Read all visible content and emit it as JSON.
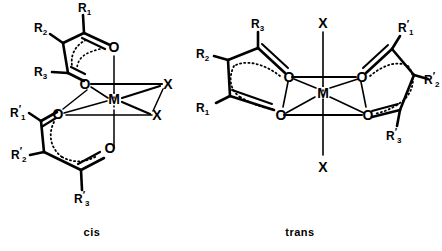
{
  "figure": {
    "title": "",
    "type": "chemical-structure-diagram",
    "background_color": "#ffffff",
    "line_color": "#000000",
    "structures": [
      {
        "id": "cis",
        "caption": "cis",
        "metal_label": "M",
        "ligand_labels": [
          "X",
          "X"
        ],
        "oxygen_labels": [
          "O",
          "O",
          "O",
          "O"
        ],
        "ring_top": {
          "substituents": [
            {
              "base": "R",
              "sub": "1",
              "prime": ""
            },
            {
              "base": "R",
              "sub": "2",
              "prime": ""
            },
            {
              "base": "R",
              "sub": "3",
              "prime": ""
            }
          ]
        },
        "ring_bottom": {
          "substituents": [
            {
              "base": "R",
              "sub": "1",
              "prime": "′"
            },
            {
              "base": "R",
              "sub": "2",
              "prime": "′"
            },
            {
              "base": "R",
              "sub": "3",
              "prime": "′"
            }
          ]
        }
      },
      {
        "id": "trans",
        "caption": "trans",
        "metal_label": "M",
        "ligand_labels": [
          "X",
          "X"
        ],
        "oxygen_labels": [
          "O",
          "O",
          "O",
          "O"
        ],
        "ring_left": {
          "substituents": [
            {
              "base": "R",
              "sub": "1",
              "prime": ""
            },
            {
              "base": "R",
              "sub": "2",
              "prime": ""
            },
            {
              "base": "R",
              "sub": "3",
              "prime": ""
            }
          ]
        },
        "ring_right": {
          "substituents": [
            {
              "base": "R",
              "sub": "1",
              "prime": "′"
            },
            {
              "base": "R",
              "sub": "2",
              "prime": "′"
            },
            {
              "base": "R",
              "sub": "3",
              "prime": "′"
            }
          ]
        }
      }
    ]
  },
  "labels": {
    "cis": {
      "metal": "M",
      "x_upper": "X",
      "x_lower": "X",
      "o_ne": "O",
      "o_nw": "O",
      "o_sw": "O",
      "o_se": "O",
      "r1": "R",
      "r1_sub": "1",
      "r2": "R",
      "r2_sub": "2",
      "r3": "R",
      "r3_sub": "3",
      "r1p": "R",
      "r1p_sub": "1",
      "r1p_prime": "′",
      "r2p": "R",
      "r2p_sub": "2",
      "r2p_prime": "′",
      "r3p": "R",
      "r3p_sub": "3",
      "r3p_prime": "′",
      "caption": "cis"
    },
    "trans": {
      "metal": "M",
      "x_top": "X",
      "x_bottom": "X",
      "o_nw": "O",
      "o_sw": "O",
      "o_ne": "O",
      "o_se": "O",
      "r1": "R",
      "r1_sub": "1",
      "r2": "R",
      "r2_sub": "2",
      "r3": "R",
      "r3_sub": "3",
      "r1p": "R",
      "r1p_sub": "1",
      "r1p_prime": "′",
      "r2p": "R",
      "r2p_sub": "2",
      "r2p_prime": "′",
      "r3p": "R",
      "r3p_sub": "3",
      "r3p_prime": "′",
      "caption": "trans"
    }
  }
}
